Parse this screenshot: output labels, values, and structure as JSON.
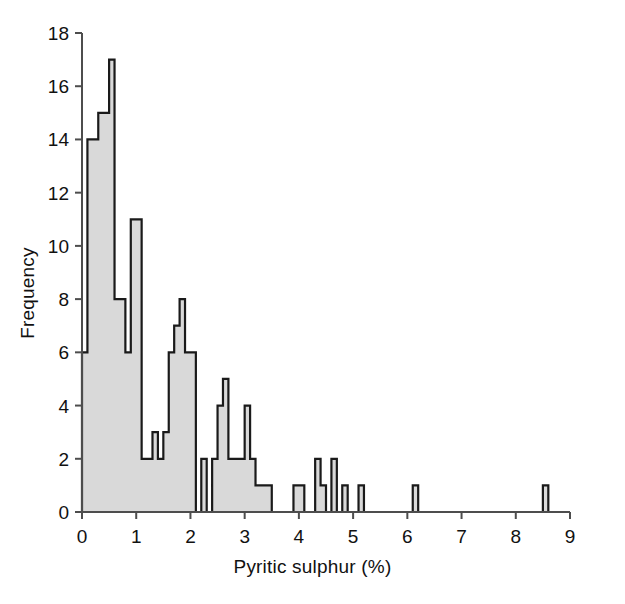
{
  "chart_data": {
    "type": "bar",
    "title": "",
    "subtitle": "",
    "xlabel": "Pyritic sulphur (%)",
    "ylabel": "Frequency",
    "xlim": [
      0,
      9
    ],
    "ylim": [
      0,
      18
    ],
    "xticks": [
      0,
      1,
      2,
      3,
      4,
      5,
      6,
      7,
      8,
      9
    ],
    "xticklabels": [
      "0",
      "1",
      "2",
      "3",
      "4",
      "5",
      "6",
      "7",
      "8",
      "9"
    ],
    "yticks": [
      0,
      2,
      4,
      6,
      8,
      10,
      12,
      14,
      16,
      18
    ],
    "yticklabels": [
      "0",
      "2",
      "4",
      "6",
      "8",
      "10",
      "12",
      "14",
      "16",
      "18"
    ],
    "grid": false,
    "legend": null,
    "bin_width": 0.1,
    "bar_fill": "#d9d9d9",
    "bar_edge": "#1a1a1a",
    "axis_color": "#4d4d4d",
    "bins": [
      {
        "x0": 0.0,
        "x1": 0.1,
        "value": 6
      },
      {
        "x0": 0.1,
        "x1": 0.2,
        "value": 14
      },
      {
        "x0": 0.2,
        "x1": 0.3,
        "value": 14
      },
      {
        "x0": 0.3,
        "x1": 0.4,
        "value": 15
      },
      {
        "x0": 0.4,
        "x1": 0.5,
        "value": 15
      },
      {
        "x0": 0.5,
        "x1": 0.6,
        "value": 17
      },
      {
        "x0": 0.6,
        "x1": 0.7,
        "value": 8
      },
      {
        "x0": 0.7,
        "x1": 0.8,
        "value": 8
      },
      {
        "x0": 0.8,
        "x1": 0.9,
        "value": 6
      },
      {
        "x0": 0.9,
        "x1": 1.0,
        "value": 11
      },
      {
        "x0": 1.0,
        "x1": 1.1,
        "value": 11
      },
      {
        "x0": 1.1,
        "x1": 1.2,
        "value": 2
      },
      {
        "x0": 1.2,
        "x1": 1.3,
        "value": 2
      },
      {
        "x0": 1.3,
        "x1": 1.4,
        "value": 3
      },
      {
        "x0": 1.4,
        "x1": 1.5,
        "value": 2
      },
      {
        "x0": 1.5,
        "x1": 1.6,
        "value": 3
      },
      {
        "x0": 1.6,
        "x1": 1.7,
        "value": 6
      },
      {
        "x0": 1.7,
        "x1": 1.8,
        "value": 7
      },
      {
        "x0": 1.8,
        "x1": 1.9,
        "value": 8
      },
      {
        "x0": 1.9,
        "x1": 2.0,
        "value": 6
      },
      {
        "x0": 2.0,
        "x1": 2.1,
        "value": 6
      },
      {
        "x0": 2.1,
        "x1": 2.2,
        "value": 0
      },
      {
        "x0": 2.2,
        "x1": 2.3,
        "value": 2
      },
      {
        "x0": 2.3,
        "x1": 2.4,
        "value": 0
      },
      {
        "x0": 2.4,
        "x1": 2.5,
        "value": 2
      },
      {
        "x0": 2.5,
        "x1": 2.6,
        "value": 4
      },
      {
        "x0": 2.6,
        "x1": 2.7,
        "value": 5
      },
      {
        "x0": 2.7,
        "x1": 2.8,
        "value": 2
      },
      {
        "x0": 2.8,
        "x1": 2.9,
        "value": 2
      },
      {
        "x0": 2.9,
        "x1": 3.0,
        "value": 2
      },
      {
        "x0": 3.0,
        "x1": 3.1,
        "value": 4
      },
      {
        "x0": 3.1,
        "x1": 3.2,
        "value": 2
      },
      {
        "x0": 3.2,
        "x1": 3.3,
        "value": 1
      },
      {
        "x0": 3.3,
        "x1": 3.4,
        "value": 1
      },
      {
        "x0": 3.4,
        "x1": 3.5,
        "value": 1
      },
      {
        "x0": 3.5,
        "x1": 3.6,
        "value": 0
      },
      {
        "x0": 3.6,
        "x1": 3.7,
        "value": 0
      },
      {
        "x0": 3.7,
        "x1": 3.8,
        "value": 0
      },
      {
        "x0": 3.8,
        "x1": 3.9,
        "value": 0
      },
      {
        "x0": 3.9,
        "x1": 4.0,
        "value": 1
      },
      {
        "x0": 4.0,
        "x1": 4.1,
        "value": 1
      },
      {
        "x0": 4.1,
        "x1": 4.2,
        "value": 0
      },
      {
        "x0": 4.2,
        "x1": 4.3,
        "value": 0
      },
      {
        "x0": 4.3,
        "x1": 4.4,
        "value": 2
      },
      {
        "x0": 4.4,
        "x1": 4.5,
        "value": 1
      },
      {
        "x0": 4.5,
        "x1": 4.6,
        "value": 0
      },
      {
        "x0": 4.6,
        "x1": 4.7,
        "value": 2
      },
      {
        "x0": 4.7,
        "x1": 4.8,
        "value": 0
      },
      {
        "x0": 4.8,
        "x1": 4.9,
        "value": 1
      },
      {
        "x0": 4.9,
        "x1": 5.0,
        "value": 0
      },
      {
        "x0": 5.0,
        "x1": 5.1,
        "value": 0
      },
      {
        "x0": 5.1,
        "x1": 5.2,
        "value": 1
      },
      {
        "x0": 5.2,
        "x1": 5.3,
        "value": 0
      },
      {
        "x0": 6.1,
        "x1": 6.2,
        "value": 1
      },
      {
        "x0": 8.5,
        "x1": 8.6,
        "value": 1
      }
    ]
  }
}
